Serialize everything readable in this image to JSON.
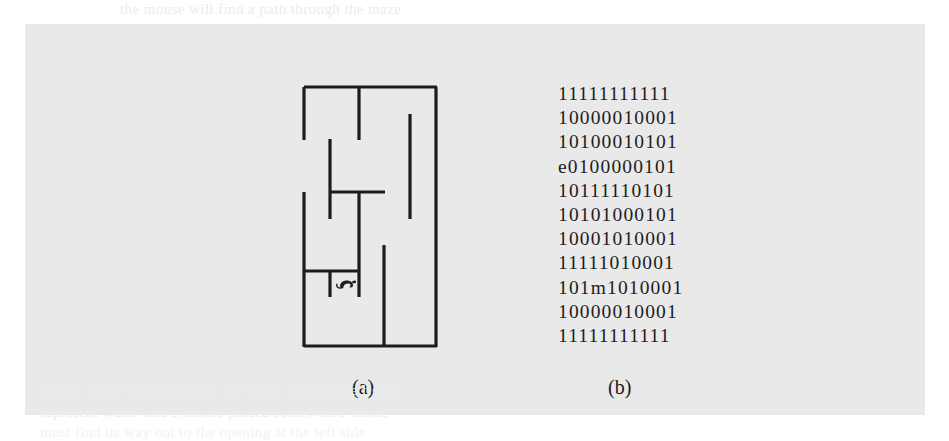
{
  "figure": {
    "background_color": "#e9e9e9",
    "page_color": "#ffffff",
    "ink_color": "#1c1c1c"
  },
  "panel_a": {
    "label": "(a)",
    "description": "maze-drawing-with-mouse",
    "mouse_glyph": "mouse-icon",
    "grid_size": "11x11",
    "walls": [
      {
        "name": "outer-top",
        "x1": 25,
        "y1": 24,
        "x2": 157,
        "y2": 24
      },
      {
        "name": "outer-left",
        "x1": 25,
        "y1": 24,
        "x2": 25,
        "y2": 283
      },
      {
        "name": "outer-right",
        "x1": 157,
        "y1": 24,
        "x2": 157,
        "y2": 283
      },
      {
        "name": "outer-bottom",
        "x1": 25,
        "y1": 283,
        "x2": 157,
        "y2": 283
      },
      {
        "name": "wall-left-upper-gap",
        "x1": 25,
        "y1": 24,
        "x2": 25,
        "y2": 76
      },
      {
        "name": "wall-v-col2-top",
        "x1": 80,
        "y1": 24,
        "x2": 80,
        "y2": 76
      },
      {
        "name": "wall-v-col1-mid",
        "x1": 51,
        "y1": 76,
        "x2": 51,
        "y2": 155
      },
      {
        "name": "wall-v-col0-mid",
        "x1": 25,
        "y1": 129,
        "x2": 25,
        "y2": 207
      },
      {
        "name": "wall-h-mid",
        "x1": 51,
        "y1": 129,
        "x2": 105,
        "y2": 129
      },
      {
        "name": "wall-v-col3-mid",
        "x1": 80,
        "y1": 129,
        "x2": 80,
        "y2": 207
      },
      {
        "name": "wall-v-col4-right",
        "x1": 131,
        "y1": 50,
        "x2": 131,
        "y2": 155
      },
      {
        "name": "wall-v-col2-lower",
        "x1": 105,
        "y1": 181,
        "x2": 105,
        "y2": 283
      },
      {
        "name": "wall-h-lower",
        "x1": 25,
        "y1": 207,
        "x2": 80,
        "y2": 207
      },
      {
        "name": "wall-v-cell-left",
        "x1": 51,
        "y1": 207,
        "x2": 51,
        "y2": 233
      },
      {
        "name": "wall-v-cell-right",
        "x1": 80,
        "y1": 207,
        "x2": 80,
        "y2": 233
      }
    ]
  },
  "panel_b": {
    "label": "(b)",
    "description": "binary-matrix-representation",
    "legend": {
      "wall": "1",
      "open": "0",
      "exit": "e",
      "mouse": "m"
    },
    "rows": [
      "11111111111",
      "10000010001",
      "10100010101",
      "e0100000101",
      "10111110101",
      "10101000101",
      "10001010001",
      "11111010001",
      "101m1010001",
      "10000010001",
      "11111111111"
    ]
  },
  "bleed_text": {
    "top": "the  mouse  will  find  a  path  through  the  maze",
    "line1": "Figure  2  The  maze  problem.  the  black  lines  in  the  figure",
    "line2": "represent  walls.  and  a  mouse  placed  somewhere  inside",
    "line3": "must  find  its  way  out  to  the  opening  at  the  left  side"
  }
}
